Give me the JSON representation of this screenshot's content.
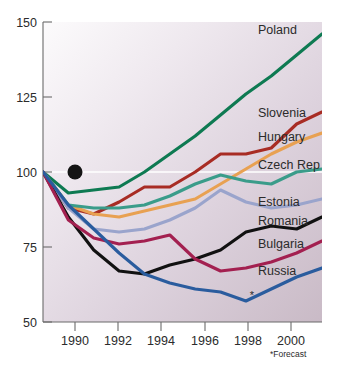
{
  "chart_data": {
    "type": "line",
    "title": "",
    "subtitle": "",
    "xlabel": "",
    "ylabel": "",
    "index_base": "1990 = 100",
    "xlim": [
      1990,
      2001
    ],
    "ylim": [
      50,
      150
    ],
    "ytick_labels": [
      "50",
      "75",
      "100",
      "125",
      "150"
    ],
    "ytick_values": [
      50,
      75,
      100,
      125,
      150
    ],
    "xtick_labels": [
      "1990",
      "1992",
      "1994",
      "1996",
      "1998",
      "2000"
    ],
    "xtick_values": [
      1990,
      1992,
      1994,
      1996,
      1998,
      2000
    ],
    "grid": false,
    "reference_line": {
      "value": 100,
      "color": "#ffffff"
    },
    "legend_position": "right-inline",
    "origin_marker": {
      "x": 1990,
      "y": 100,
      "color": "#141414"
    },
    "annotations": [
      {
        "text": "*Forecast",
        "x": 2000.4,
        "y": 44
      },
      {
        "text": "*",
        "x": 1999.2,
        "y": 58.5
      }
    ],
    "x": [
      1990,
      1991,
      1992,
      1993,
      1994,
      1995,
      1996,
      1997,
      1998,
      1999,
      2000,
      2001
    ],
    "series": [
      {
        "name": "Poland",
        "color": "#0E7A52",
        "values": [
          100,
          93,
          94,
          95,
          100,
          106,
          112,
          119,
          126,
          132,
          139,
          146
        ]
      },
      {
        "name": "Slovenia",
        "color": "#A82C24",
        "values": [
          100,
          88,
          86,
          90,
          95,
          95,
          100,
          106,
          106,
          108,
          116,
          120
        ]
      },
      {
        "name": "Hungary",
        "color": "#E8A152",
        "values": [
          100,
          89,
          86,
          85,
          87,
          89,
          91,
          96,
          101,
          106,
          110,
          113
        ]
      },
      {
        "name": "Czech Rep",
        "color": "#3A9C8A",
        "values": [
          100,
          89,
          88,
          88,
          89,
          92,
          96,
          99,
          97,
          96,
          100,
          101
        ]
      },
      {
        "name": "Estonia",
        "color": "#9AA4CC",
        "values": [
          100,
          88,
          81,
          80,
          81,
          84,
          88,
          94,
          90,
          88,
          89,
          91
        ]
      },
      {
        "name": "Romania",
        "color": "#111111",
        "values": [
          100,
          85,
          74,
          67,
          66,
          69,
          71,
          74,
          80,
          82,
          81,
          85
        ]
      },
      {
        "name": "Bulgaria",
        "color": "#A32050",
        "values": [
          100,
          84,
          78,
          76,
          77,
          79,
          71,
          67,
          68,
          70,
          73,
          77
        ]
      },
      {
        "name": "Russia",
        "color": "#2A5C9E",
        "values": [
          100,
          89,
          81,
          73,
          66,
          63,
          61,
          60,
          57,
          61,
          65,
          68
        ]
      }
    ],
    "series_labels": [
      {
        "name": "Poland",
        "label": "Poland",
        "x": 258,
        "y": 34
      },
      {
        "name": "Slovenia",
        "label": "Slovenia",
        "x": 258,
        "y": 117
      },
      {
        "name": "Hungary",
        "label": "Hungary",
        "x": 258,
        "y": 141
      },
      {
        "name": "Czech Rep",
        "label": "Czech Rep",
        "x": 258,
        "y": 169
      },
      {
        "name": "Estonia",
        "label": "Estonia",
        "x": 258,
        "y": 206
      },
      {
        "name": "Romania",
        "label": "Romania",
        "x": 258,
        "y": 225
      },
      {
        "name": "Bulgaria",
        "label": "Bulgaria",
        "x": 258,
        "y": 248
      },
      {
        "name": "Russia",
        "label": "Russia",
        "x": 258,
        "y": 275
      }
    ]
  },
  "background": {
    "page": "#ffffff",
    "plot_gradient_from": "#fbfafb",
    "plot_gradient_to": "#cbbcc8"
  },
  "footnote": "*Forecast"
}
